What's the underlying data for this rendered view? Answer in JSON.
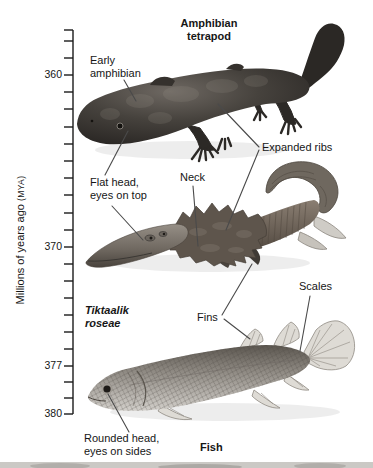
{
  "header": {
    "title_line1": "Amphibian",
    "title_line2": "tetrapod"
  },
  "timeline": {
    "axis_title_main": "Millions of years ago ",
    "axis_title_unit": "(MYA)",
    "labels": [
      {
        "text": "360",
        "y": 75
      },
      {
        "text": "370",
        "y": 247
      },
      {
        "text": "377",
        "y": 366
      },
      {
        "text": "380",
        "y": 414
      }
    ],
    "tick_ys": [
      30,
      41,
      58,
      75,
      92,
      109,
      127,
      144,
      161,
      178,
      195,
      213,
      230,
      247,
      264,
      281,
      298,
      315,
      332,
      349,
      366,
      382,
      398,
      414
    ],
    "axis_top_y": 30,
    "axis_bottom_y": 414
  },
  "annotations": {
    "early_amphibian": {
      "line1": "Early",
      "line2": "amphibian"
    },
    "flat_head": {
      "line1": "Flat head,",
      "line2": "eyes on top"
    },
    "neck": {
      "label": "Neck"
    },
    "expanded_ribs": {
      "label": "Expanded ribs"
    },
    "fins": {
      "label": "Fins"
    },
    "scales": {
      "label": "Scales"
    },
    "rounded_head": {
      "line1": "Rounded head,",
      "line2": "eyes on sides"
    }
  },
  "organisms": {
    "amphibian": {
      "name_line1": "Amphibian",
      "name_line2": "tetrapod"
    },
    "tiktaalik": {
      "name_line1": "Tiktaalik",
      "name_line2": "roseae"
    },
    "fish": {
      "label": "Fish"
    }
  },
  "leader_lines": [
    {
      "x1": 124,
      "y1": 80,
      "x2": 136,
      "y2": 101
    },
    {
      "x1": 105,
      "y1": 175,
      "x2": 128,
      "y2": 131
    },
    {
      "x1": 112,
      "y1": 206,
      "x2": 143,
      "y2": 240
    },
    {
      "x1": 193,
      "y1": 186,
      "x2": 198,
      "y2": 246
    },
    {
      "x1": 259,
      "y1": 147,
      "x2": 218,
      "y2": 104
    },
    {
      "x1": 259,
      "y1": 150,
      "x2": 226,
      "y2": 230
    },
    {
      "x1": 222,
      "y1": 315,
      "x2": 252,
      "y2": 264
    },
    {
      "x1": 224,
      "y1": 319,
      "x2": 250,
      "y2": 339
    },
    {
      "x1": 310,
      "y1": 296,
      "x2": 300,
      "y2": 351
    },
    {
      "x1": 129,
      "y1": 432,
      "x2": 108,
      "y2": 394
    }
  ],
  "colors": {
    "text": "#161616",
    "leader_line": "#4a4a4a",
    "axis": "#1a1a1a",
    "amphibian_dark": "#2e2b28",
    "tiktaalik_mid": "#7d7166",
    "fish_body": "#8f8a83",
    "fin_pale": "#dedbd5"
  }
}
